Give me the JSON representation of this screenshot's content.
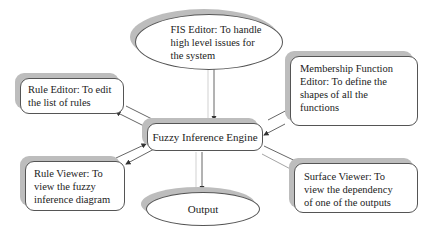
{
  "diagram": {
    "nodes": {
      "fis_editor": {
        "label": "FIS Editor: To handle\nhigh level issues for\nthe system",
        "shape": "ellipse"
      },
      "rule_editor": {
        "label": "Rule Editor: To edit\nthe list of rules",
        "shape": "rounded-rect"
      },
      "membership_editor": {
        "label": "Membership Function\nEditor: To define the\nshapes of all the\nfunctions",
        "shape": "rounded-rect"
      },
      "engine": {
        "label": "Fuzzy Inference Engine",
        "shape": "rounded-rect"
      },
      "rule_viewer": {
        "label": "Rule Viewer: To\nview the fuzzy\ninference diagram",
        "shape": "rounded-rect"
      },
      "surface_viewer": {
        "label": "Surface Viewer: To\nview the dependency\nof one of the outputs",
        "shape": "rounded-rect"
      },
      "output": {
        "label": "Output",
        "shape": "ellipse"
      }
    },
    "edges": [
      {
        "from": "fis_editor",
        "to": "engine",
        "direction": "one-way"
      },
      {
        "from": "rule_editor",
        "to": "engine",
        "direction": "two-way"
      },
      {
        "from": "membership_editor",
        "to": "engine",
        "direction": "two-way"
      },
      {
        "from": "rule_viewer",
        "to": "engine",
        "direction": "two-way"
      },
      {
        "from": "surface_viewer",
        "to": "engine",
        "direction": "two-way"
      },
      {
        "from": "engine",
        "to": "output",
        "direction": "one-way"
      }
    ],
    "colors": {
      "border": "#555555",
      "shadow": "#bdbdbd",
      "arrow": "#333333"
    }
  }
}
